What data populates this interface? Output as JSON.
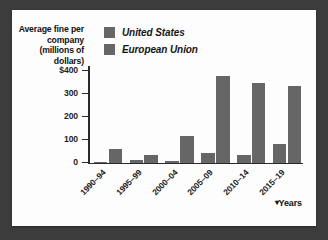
{
  "figure": {
    "background_color": "#3c3c3c",
    "card_color": "#fdfdfd",
    "bar_color": "#666666"
  },
  "legend": {
    "items": [
      {
        "label": "United States",
        "color": "#666666"
      },
      {
        "label": "European Union",
        "color": "#666666"
      }
    ]
  },
  "axis": {
    "y_title": "Average fine per company (millions of dollars)",
    "y_ticks": [
      "$400",
      "300",
      "200",
      "100",
      "0"
    ],
    "x_title": "Years",
    "x_title_caret": "▾"
  },
  "chart_data": {
    "type": "bar",
    "title": "Average fine per company (millions of dollars)",
    "xlabel": "Years",
    "ylabel": "Average fine per company (millions of dollars)",
    "ylim": [
      0,
      420
    ],
    "yticks": [
      0,
      100,
      200,
      300,
      400
    ],
    "ytick_labels": [
      "0",
      "100",
      "200",
      "300",
      "$400"
    ],
    "grid": false,
    "legend_position": "top-left",
    "categories": [
      "1990–94",
      "1995–99",
      "2000–04",
      "2005–09",
      "2010–14",
      "2015–19"
    ],
    "series": [
      {
        "name": "United States",
        "color": "#666666",
        "values": [
          3,
          12,
          8,
          42,
          35,
          82
        ]
      },
      {
        "name": "European Union",
        "color": "#666666",
        "values": [
          60,
          33,
          115,
          375,
          348,
          335
        ]
      }
    ]
  }
}
